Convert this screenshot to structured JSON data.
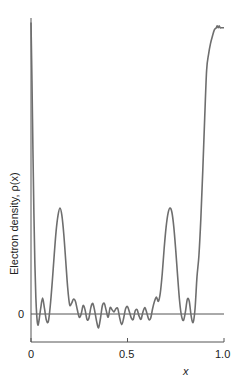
{
  "chart_data": {
    "type": "line",
    "title": "",
    "xlabel": "x",
    "ylabel": "Electron density, ρ(x)",
    "xlim": [
      0,
      1.0
    ],
    "ylim": [
      -0.27,
      2.78
    ],
    "x_ticks": [
      0,
      0.5,
      1.0
    ],
    "x_tick_labels": [
      "0",
      "0.5",
      "1.0"
    ],
    "y_ticks": [
      0
    ],
    "y_tick_labels": [
      "0"
    ],
    "grid": false,
    "legend": null,
    "zero_line": true,
    "series": [
      {
        "name": "rho(x)",
        "color": "#6e6e6e",
        "x": [
          0.0,
          0.005,
          0.01,
          0.015,
          0.02,
          0.025,
          0.03,
          0.035,
          0.04,
          0.05,
          0.06,
          0.07,
          0.08,
          0.09,
          0.1,
          0.11,
          0.12,
          0.13,
          0.14,
          0.15,
          0.16,
          0.17,
          0.18,
          0.19,
          0.2,
          0.21,
          0.22,
          0.23,
          0.24,
          0.25,
          0.26,
          0.27,
          0.28,
          0.29,
          0.3,
          0.31,
          0.32,
          0.33,
          0.34,
          0.35,
          0.36,
          0.37,
          0.38,
          0.39,
          0.4,
          0.41,
          0.42,
          0.43,
          0.44,
          0.45,
          0.46,
          0.47,
          0.48,
          0.49,
          0.5,
          0.51,
          0.52,
          0.53,
          0.54,
          0.55,
          0.56,
          0.57,
          0.58,
          0.59,
          0.6,
          0.61,
          0.62,
          0.63,
          0.64,
          0.65,
          0.66,
          0.67,
          0.68,
          0.69,
          0.7,
          0.71,
          0.72,
          0.73,
          0.74,
          0.75,
          0.76,
          0.77,
          0.78,
          0.79,
          0.8,
          0.81,
          0.82,
          0.83,
          0.84,
          0.85,
          0.86,
          0.87,
          0.88,
          0.89,
          0.9,
          0.91,
          0.92,
          0.93,
          0.94,
          0.95,
          0.96,
          0.965,
          0.97,
          0.975,
          0.98,
          0.985,
          0.99,
          0.995,
          1.0
        ],
        "y": [
          2.75,
          2.2,
          1.55,
          0.95,
          0.48,
          0.16,
          -0.02,
          -0.1,
          -0.08,
          0.05,
          0.15,
          0.05,
          -0.06,
          -0.07,
          0.08,
          0.3,
          0.55,
          0.78,
          0.93,
          1.0,
          0.93,
          0.75,
          0.5,
          0.25,
          0.09,
          0.1,
          0.14,
          0.12,
          0.04,
          -0.03,
          0.0,
          0.08,
          0.04,
          -0.05,
          -0.04,
          0.06,
          0.1,
          0.03,
          -0.07,
          -0.13,
          -0.04,
          0.08,
          0.1,
          0.03,
          -0.03,
          0.06,
          0.04,
          0.02,
          0.05,
          0.05,
          -0.04,
          -0.1,
          -0.04,
          0.05,
          0.07,
          0.02,
          -0.04,
          -0.05,
          0.03,
          0.04,
          -0.02,
          -0.05,
          0.02,
          0.06,
          0.01,
          -0.05,
          -0.04,
          0.05,
          0.12,
          0.16,
          0.12,
          0.2,
          0.38,
          0.62,
          0.82,
          0.95,
          1.0,
          0.96,
          0.82,
          0.6,
          0.35,
          0.12,
          -0.02,
          -0.06,
          0.02,
          0.14,
          0.12,
          -0.02,
          -0.08,
          0.05,
          0.35,
          0.55,
          0.9,
          1.35,
          1.85,
          2.3,
          2.45,
          2.55,
          2.62,
          2.68,
          2.7,
          2.72,
          2.7,
          2.72,
          2.7,
          2.7,
          2.7,
          2.7,
          2.7
        ],
        "description": "Periodic electron density with sharp spikes at x=0 and x=1.0, main peaks near x=0.2 and x=0.8 of height ~1.0 (relative), small oscillatory ripples about zero in between."
      }
    ],
    "annotations": []
  },
  "style": {
    "line_color": "#6e6e6e",
    "axis_color": "#555555",
    "text_color": "#222222",
    "background": "#ffffff"
  }
}
